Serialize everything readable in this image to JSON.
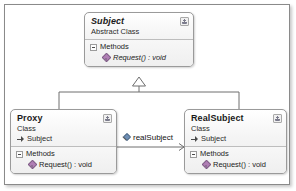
{
  "diagram": {
    "type": "uml-class-diagram",
    "pattern": "Proxy",
    "classes": [
      {
        "id": "subject",
        "name": "Subject",
        "stereotype": "Abstract Class",
        "is_abstract": true,
        "base": null,
        "compartment_label": "Methods",
        "members": [
          {
            "text": "Request() : void",
            "kind": "method",
            "is_abstract": true
          }
        ]
      },
      {
        "id": "proxy",
        "name": "Proxy",
        "stereotype": "Class",
        "is_abstract": false,
        "base": "Subject",
        "compartment_label": "Methods",
        "members": [
          {
            "text": "Request() : void",
            "kind": "method",
            "is_abstract": false
          }
        ]
      },
      {
        "id": "realsubject",
        "name": "RealSubject",
        "stereotype": "Class",
        "is_abstract": false,
        "base": "Subject",
        "compartment_label": "Methods",
        "members": [
          {
            "text": "Request() : void",
            "kind": "method",
            "is_abstract": false
          }
        ]
      }
    ],
    "relationships": [
      {
        "kind": "inheritance",
        "from": "Proxy",
        "to": "Subject",
        "label": ""
      },
      {
        "kind": "inheritance",
        "from": "RealSubject",
        "to": "Subject",
        "label": ""
      },
      {
        "kind": "association",
        "from": "Proxy",
        "to": "RealSubject",
        "label": "realSubject"
      }
    ],
    "icons": {
      "class_toggle": "collapse-class-icon",
      "compartment_expander": "minus-expander-icon",
      "method": "method-icon",
      "field": "field-icon",
      "inheritance_arrow": "hollow-triangle-icon",
      "association_arrow": "open-arrow-icon"
    },
    "colors": {
      "frame_border": "#8a8a8a",
      "class_border": "#9a9a9a",
      "connector": "#6e6e6e",
      "method_icon": "#b07fb5",
      "field_icon": "#6f8fb5",
      "canvas": "#ffffff"
    }
  }
}
